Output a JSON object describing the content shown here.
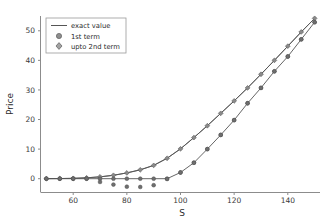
{
  "chart_data": {
    "type": "line",
    "title": "",
    "xlabel": "S",
    "ylabel": "Price",
    "xlim": [
      48,
      152
    ],
    "ylim": [
      -4.5,
      55
    ],
    "xticks": [
      60,
      80,
      100,
      120,
      140
    ],
    "yticks": [
      0,
      10,
      20,
      30,
      40,
      50
    ],
    "grid": false,
    "legend_position": "upper left",
    "legend_entries": [
      {
        "label": "exact value",
        "marker": "line",
        "color": "#555555"
      },
      {
        "label": "1st term",
        "marker": "circle",
        "color": "#6e6e6e"
      },
      {
        "label": "upto 2nd term",
        "marker": "diamond",
        "color": "#8a8a8a"
      }
    ],
    "x": [
      50,
      55,
      60,
      65,
      70,
      75,
      80,
      85,
      90,
      95,
      100,
      105,
      110,
      115,
      120,
      125,
      130,
      135,
      140,
      145,
      150
    ],
    "series": [
      {
        "name": "exact value",
        "style": "line",
        "values": [
          0.02,
          0.05,
          0.12,
          0.3,
          0.62,
          1.15,
          1.95,
          3.0,
          4.5,
          6.9,
          10.1,
          13.9,
          17.9,
          22.1,
          26.3,
          30.7,
          35.3,
          40.0,
          44.8,
          49.6,
          54.2
        ]
      },
      {
        "name": "upto 2nd term",
        "style": "line+marker",
        "values": [
          0.02,
          0.05,
          0.12,
          0.3,
          0.62,
          1.15,
          1.95,
          3.0,
          4.5,
          6.9,
          10.1,
          13.9,
          17.9,
          22.1,
          26.3,
          30.7,
          35.3,
          40.0,
          44.8,
          49.6,
          54.2
        ]
      },
      {
        "name": "1st term",
        "style": "line+marker",
        "values": [
          0.0,
          0.0,
          0.0,
          0.0,
          0.0,
          0.0,
          0.0,
          0.0,
          0.0,
          0.0,
          2.1,
          5.4,
          10.0,
          14.8,
          19.8,
          25.5,
          30.7,
          36.3,
          41.3,
          47.1,
          52.9
        ]
      },
      {
        "name": "1st term scattered",
        "style": "marker-only",
        "values": [
          0.0,
          0.0,
          0.0,
          0.0,
          -1.1,
          -2.0,
          -2.7,
          -2.8,
          -2.2,
          -0.1,
          2.1,
          5.4,
          10.0,
          14.8,
          19.8,
          25.5,
          30.7,
          36.3,
          41.3,
          47.1,
          52.9
        ]
      }
    ]
  },
  "colors": {
    "line": "#555555",
    "marker_first": "#6e6e6e",
    "marker_second": "#8a8a8a",
    "axis": "#8c8c8c",
    "text": "#2b2b2b",
    "legend_border": "#9a9a9a",
    "background": "#ffffff"
  }
}
